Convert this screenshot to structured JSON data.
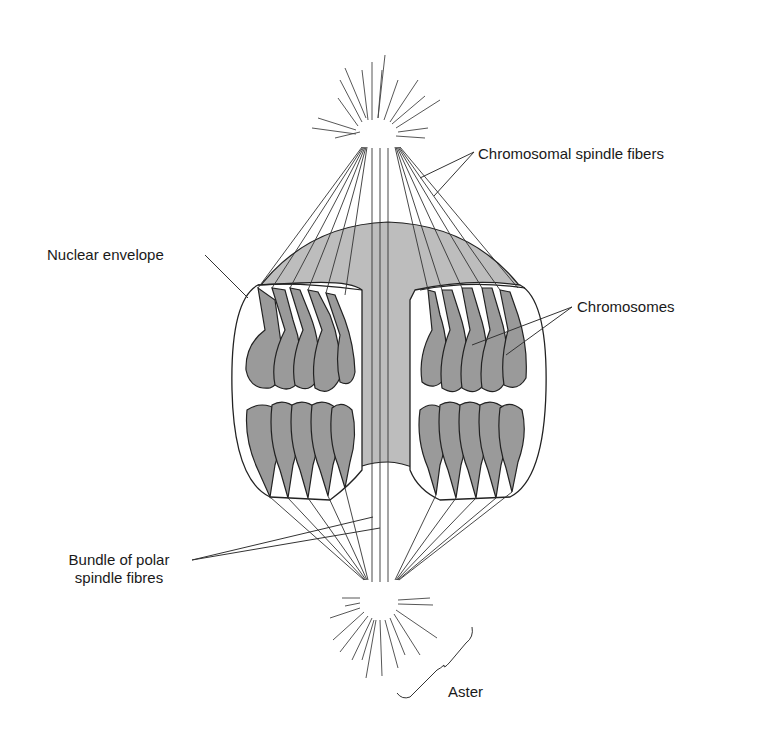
{
  "labels": {
    "chromosomal_spindle_fibers": "Chromosomal spindle fibers",
    "nuclear_envelope": "Nuclear envelope",
    "chromosomes": "Chromosomes",
    "bundle_polar_line1": "Bundle of polar",
    "bundle_polar_line2": "spindle fibres",
    "aster": "Aster"
  },
  "colors": {
    "chromosome_fill": "#9a9a9a",
    "spindle_fill": "#bdbdbd",
    "line": "#222222",
    "background": "#ffffff"
  },
  "structures": {
    "upper_pole": {
      "x": 388,
      "y": 128
    },
    "lower_pole": {
      "x": 388,
      "y": 598
    },
    "left_nucleus_chromosome_groups": 2,
    "right_nucleus_chromosome_groups": 2
  }
}
